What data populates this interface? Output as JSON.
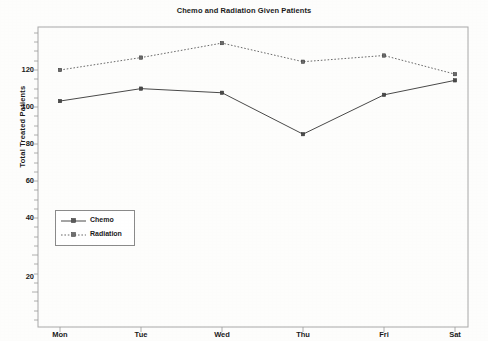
{
  "chart_data": {
    "type": "line",
    "title": "Chemo and Radiation Given Patients",
    "xlabel": "",
    "ylabel": "Total Treated Patients",
    "categories": [
      "Mon",
      "Tue",
      "Wed",
      "Thu",
      "Fri",
      "Sat"
    ],
    "series": [
      {
        "name": "Chemo",
        "values": [
          105,
          111,
          109,
          89,
          108,
          115
        ],
        "linestyle": "solid",
        "marker": "square",
        "color": "#4a4a4a"
      },
      {
        "name": "Radiation",
        "values": [
          120,
          126,
          133,
          124,
          127,
          118
        ],
        "linestyle": "dotted",
        "marker": "square",
        "color": "#6b6b6b"
      }
    ],
    "ylim": [
      0,
      140
    ],
    "yticks": [
      20,
      40,
      60,
      80,
      100,
      120
    ],
    "ytick_labels": [
      "20",
      "40",
      "60",
      "80",
      "100",
      "120"
    ],
    "grid": false,
    "legend_position": "center-left"
  },
  "legend": {
    "entries": [
      {
        "label": "Chemo"
      },
      {
        "label": "Radiation"
      }
    ]
  },
  "axis": {
    "y_label": "Total Treated Patients",
    "y_ticks": [
      "120",
      "100",
      "80",
      "60",
      "40",
      "20"
    ],
    "x_ticks": [
      "Mon",
      "Tue",
      "Wed",
      "Thu",
      "Fri",
      "Sat"
    ]
  },
  "colors": {
    "background": "#fdfdfc",
    "axis": "#8a8a8a",
    "chemo": "#4a4a4a",
    "radiation": "#6b6b6b",
    "text": "#1b1b1b"
  }
}
